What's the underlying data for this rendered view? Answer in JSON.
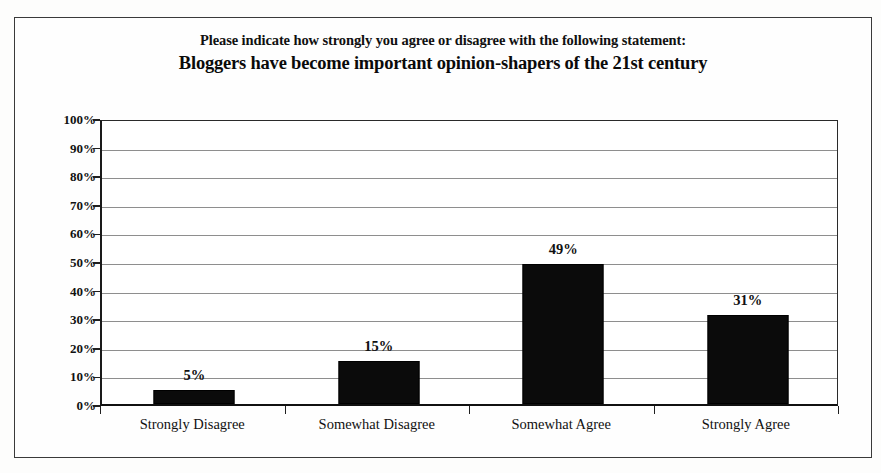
{
  "chart_data": {
    "type": "bar",
    "title": "Please indicate how strongly you agree or disagree with the following statement: Bloggers have become important opinion-shapers of the 21st century",
    "title_line1": "Please indicate how strongly you agree or disagree with the following statement:",
    "title_line2": "Bloggers have become important opinion-shapers of the 21st century",
    "categories": [
      "Strongly Disagree",
      "Somewhat Disagree",
      "Somewhat Agree",
      "Strongly Agree"
    ],
    "values": [
      5,
      15,
      49,
      31
    ],
    "data_labels": [
      "5%",
      "15%",
      "49%",
      "31%"
    ],
    "xlabel": "",
    "ylabel": "",
    "ylim": [
      0,
      100
    ],
    "ytick_values": [
      0,
      10,
      20,
      30,
      40,
      50,
      60,
      70,
      80,
      90,
      100
    ],
    "ytick_labels": [
      "0%",
      "10%",
      "20%",
      "30%",
      "40%",
      "50%",
      "60%",
      "70%",
      "80%",
      "90%",
      "100%"
    ],
    "grid": true,
    "legend": false,
    "bar_color": "#0b0b0b",
    "plot_background": "#ffffff",
    "axis_color": "#1a1a1a",
    "gridline_color": "#8e8e8e"
  }
}
